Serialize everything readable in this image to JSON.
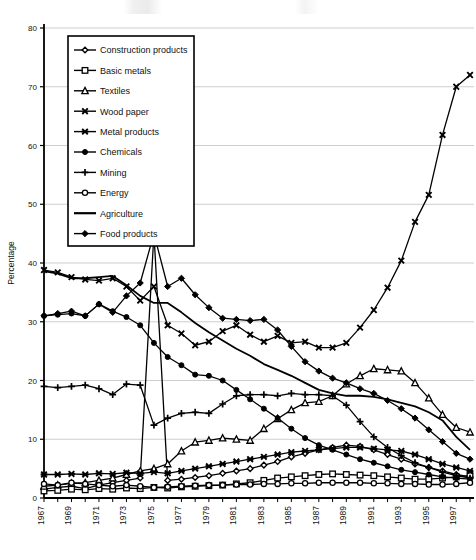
{
  "chart_data": {
    "type": "line",
    "title": "",
    "xlabel": "",
    "ylabel": "Percentage",
    "ylim": [
      0,
      80
    ],
    "ytick_values": [
      0,
      10,
      20,
      30,
      40,
      50,
      60,
      70,
      80
    ],
    "ytick_labels": [
      "0",
      "10",
      "20",
      "30",
      "40",
      "50",
      "60",
      "70",
      "80"
    ],
    "grid": "horizontal",
    "legend_position": "upper-left-inside",
    "x": [
      1967,
      1968,
      1969,
      1970,
      1971,
      1972,
      1973,
      1974,
      1975,
      1976,
      1977,
      1978,
      1979,
      1980,
      1981,
      1982,
      1983,
      1984,
      1985,
      1986,
      1987,
      1988,
      1989,
      1990,
      1991,
      1992,
      1993,
      1994,
      1995,
      1996,
      1997,
      1998
    ],
    "xtick_labels": [
      "1967",
      "1969",
      "1971",
      "1973",
      "1975",
      "1977",
      "1979",
      "1981",
      "1983",
      "1985",
      "1987",
      "1989",
      "1991",
      "1993",
      "1995",
      "1997"
    ],
    "xtick_values": [
      1967,
      1969,
      1971,
      1973,
      1975,
      1977,
      1979,
      1981,
      1983,
      1985,
      1987,
      1989,
      1991,
      1993,
      1995,
      1997
    ],
    "series": [
      {
        "name": "Construction products",
        "marker": "open-diamond",
        "values": [
          1.5,
          1.8,
          2.0,
          1.6,
          2.2,
          2.6,
          3.0,
          3.4,
          45.0,
          3.0,
          3.2,
          3.5,
          3.8,
          4.2,
          4.6,
          5.0,
          5.6,
          6.2,
          7.0,
          7.6,
          8.2,
          8.6,
          9.0,
          8.8,
          8.2,
          7.4,
          6.6,
          5.8,
          5.2,
          4.6,
          4.0,
          3.6
        ]
      },
      {
        "name": "Basic metals",
        "marker": "open-square",
        "values": [
          1.2,
          1.3,
          1.5,
          1.4,
          1.6,
          1.5,
          1.7,
          1.6,
          1.8,
          1.7,
          1.9,
          2.0,
          2.1,
          2.2,
          2.4,
          2.6,
          3.0,
          3.4,
          3.6,
          3.8,
          4.0,
          4.1,
          4.0,
          3.9,
          3.8,
          3.6,
          3.4,
          3.2,
          3.2,
          3.4,
          3.6,
          3.8
        ]
      },
      {
        "name": "Textiles",
        "marker": "open-triangle",
        "values": [
          2.0,
          2.2,
          2.5,
          2.6,
          3.0,
          3.4,
          4.0,
          4.6,
          5.0,
          5.8,
          8.0,
          9.5,
          9.8,
          10.2,
          10.0,
          9.8,
          11.8,
          13.5,
          15.0,
          16.2,
          16.4,
          17.4,
          19.4,
          20.8,
          22.0,
          21.8,
          21.6,
          19.6,
          17.0,
          14.2,
          12.0,
          11.2
        ]
      },
      {
        "name": "Wood paper",
        "marker": "x-cross",
        "values": [
          38.8,
          38.4,
          37.6,
          37.2,
          37.0,
          37.4,
          36.0,
          33.6,
          36.0,
          29.4,
          28.0,
          26.0,
          26.6,
          28.4,
          29.4,
          27.8,
          26.6,
          27.6,
          26.4,
          26.6,
          25.6,
          25.6,
          26.4,
          29.0,
          32.0,
          35.8,
          40.4,
          47.0,
          51.6,
          61.8,
          70.0,
          72.0
        ]
      },
      {
        "name": "Metal products",
        "marker": "asterisk",
        "values": [
          4.0,
          4.0,
          4.1,
          4.0,
          4.2,
          4.1,
          4.3,
          4.2,
          4.4,
          4.2,
          4.6,
          5.0,
          5.4,
          5.8,
          6.2,
          6.6,
          7.0,
          7.4,
          7.8,
          8.0,
          8.2,
          8.4,
          8.6,
          8.6,
          8.4,
          8.2,
          8.0,
          7.4,
          6.6,
          5.8,
          5.2,
          4.6
        ]
      },
      {
        "name": "Chemicals",
        "marker": "filled-circle",
        "values": [
          31.0,
          31.2,
          31.4,
          31.0,
          33.0,
          31.8,
          30.8,
          29.4,
          26.4,
          24.0,
          22.6,
          21.0,
          20.8,
          20.0,
          18.4,
          16.8,
          15.2,
          13.6,
          11.8,
          10.2,
          9.0,
          8.2,
          7.4,
          6.6,
          6.0,
          5.4,
          4.8,
          4.4,
          4.0,
          3.6,
          3.4,
          3.2
        ]
      },
      {
        "name": "Mining",
        "marker": "plus",
        "values": [
          19.0,
          18.8,
          19.0,
          19.2,
          18.6,
          17.6,
          19.4,
          19.2,
          12.4,
          13.6,
          14.4,
          14.6,
          14.4,
          16.0,
          17.4,
          17.6,
          17.6,
          17.4,
          17.8,
          17.6,
          17.6,
          17.4,
          15.8,
          13.0,
          10.4,
          8.6,
          7.2,
          6.0,
          5.2,
          4.4,
          3.8,
          3.4
        ]
      },
      {
        "name": "Energy",
        "marker": "open-circle",
        "values": [
          2.4,
          2.2,
          2.6,
          2.4,
          2.2,
          2.0,
          2.2,
          2.0,
          1.8,
          1.9,
          2.0,
          2.1,
          2.2,
          2.2,
          2.3,
          2.3,
          2.4,
          2.4,
          2.5,
          2.5,
          2.6,
          2.6,
          2.6,
          2.6,
          2.5,
          2.5,
          2.4,
          2.4,
          2.3,
          2.3,
          2.4,
          2.6
        ]
      },
      {
        "name": "Agriculture",
        "marker": "none",
        "values": [
          38.6,
          38.2,
          37.4,
          37.4,
          37.6,
          37.8,
          36.2,
          34.4,
          33.2,
          33.2,
          31.6,
          29.8,
          28.2,
          26.8,
          25.4,
          24.2,
          22.8,
          21.8,
          20.8,
          19.6,
          18.4,
          17.8,
          17.4,
          17.4,
          17.2,
          16.8,
          16.2,
          15.6,
          14.6,
          13.2,
          10.4,
          8.2
        ]
      },
      {
        "name": "Food products",
        "marker": "filled-diamond",
        "values": [
          31.0,
          31.4,
          31.8,
          31.0,
          33.0,
          31.6,
          34.4,
          36.6,
          45.0,
          36.0,
          37.4,
          34.6,
          32.4,
          30.6,
          30.4,
          30.2,
          30.4,
          28.6,
          25.8,
          23.2,
          21.6,
          20.4,
          19.6,
          18.6,
          17.8,
          16.6,
          15.2,
          13.6,
          11.6,
          9.6,
          7.6,
          6.6
        ]
      }
    ]
  },
  "legend": {
    "items": [
      {
        "label": "Construction products",
        "marker": "open-diamond"
      },
      {
        "label": "Basic metals",
        "marker": "open-square"
      },
      {
        "label": "Textiles",
        "marker": "open-triangle"
      },
      {
        "label": "Wood paper",
        "marker": "x-cross"
      },
      {
        "label": "Metal products",
        "marker": "asterisk"
      },
      {
        "label": "Chemicals",
        "marker": "filled-circle"
      },
      {
        "label": "Mining",
        "marker": "plus"
      },
      {
        "label": "Energy",
        "marker": "open-circle"
      },
      {
        "label": "Agriculture",
        "marker": "none"
      },
      {
        "label": "Food products",
        "marker": "filled-diamond"
      }
    ]
  },
  "colors": {
    "ink": "#000000",
    "grid": "#b9b9b9",
    "background": "#ffffff"
  }
}
